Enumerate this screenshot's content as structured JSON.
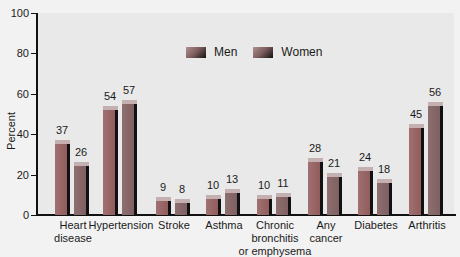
{
  "chart_data": {
    "type": "bar",
    "title": "",
    "xlabel": "",
    "ylabel": "Percent",
    "ylim": [
      0,
      100
    ],
    "yticks": [
      0,
      20,
      40,
      60,
      80,
      100
    ],
    "categories": [
      "Heart disease",
      "Hypertension",
      "Stroke",
      "Asthma",
      "Chronic bronchitis or emphysema",
      "Any cancer",
      "Diabetes",
      "Arthritis"
    ],
    "series": [
      {
        "name": "Men",
        "values": [
          37,
          54,
          9,
          10,
          10,
          28,
          24,
          45
        ]
      },
      {
        "name": "Women",
        "values": [
          26,
          57,
          8,
          13,
          11,
          21,
          18,
          56
        ]
      }
    ],
    "legend_position": "top-center",
    "grid": false
  },
  "labels": {
    "ylabel": "Percent",
    "yticks": [
      "0",
      "20",
      "40",
      "60",
      "80",
      "100"
    ],
    "categories": [
      [
        "Heart",
        "disease"
      ],
      [
        "Hypertension"
      ],
      [
        "Stroke"
      ],
      [
        "Asthma"
      ],
      [
        "Chronic",
        "bronchitis",
        "or emphysema"
      ],
      [
        "Any",
        "cancer"
      ],
      [
        "Diabetes"
      ],
      [
        "Arthritis"
      ]
    ],
    "men_values": [
      "37",
      "54",
      "9",
      "10",
      "10",
      "28",
      "24",
      "45"
    ],
    "women_values": [
      "26",
      "57",
      "8",
      "13",
      "11",
      "21",
      "18",
      "56"
    ],
    "legend": [
      "Men",
      "Women"
    ]
  },
  "colors": {
    "men_bar": "#9a6868",
    "women_bar": "#86686a",
    "bar_side": "#111111",
    "plot_bg": "#e9e9e9"
  }
}
